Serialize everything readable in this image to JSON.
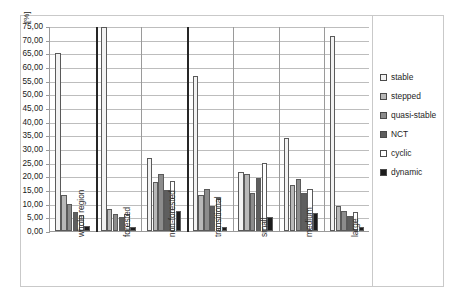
{
  "chart_data": {
    "type": "bar",
    "title": "",
    "subtitle": "",
    "xlabel": "",
    "ylabel": "[%]",
    "ylim": [
      0,
      75
    ],
    "ytick_step": 5,
    "grid": true,
    "legend_position": "right",
    "ytick_labels": [
      "75,00",
      "70,00",
      "65,00",
      "60,00",
      "55,00",
      "50,00",
      "45,00",
      "40,00",
      "35,00",
      "30,00",
      "25,00",
      "20,00",
      "15,00",
      "10,00",
      "5,00",
      "0,00"
    ],
    "categories": [
      "whole region",
      "forested",
      "non-forested",
      "transitional",
      "small",
      "medium",
      "large"
    ],
    "series": [
      {
        "name": "stable",
        "swatch": "#f2f2f2",
        "values": [
          65.2,
          74.8,
          26.8,
          56.6,
          21.5,
          34.0,
          71.5
        ]
      },
      {
        "name": "stepped",
        "swatch": "#b8b8b8",
        "values": [
          13.2,
          8.2,
          18.0,
          13.2,
          21.0,
          17.0,
          9.0
        ]
      },
      {
        "name": "quasi-stable",
        "swatch": "#8c8c8c",
        "values": [
          9.8,
          6.2,
          21.0,
          15.4,
          14.0,
          19.2,
          7.5
        ]
      },
      {
        "name": "NCT",
        "swatch": "#5e5e5e",
        "values": [
          6.8,
          5.0,
          15.0,
          9.0,
          19.5,
          13.8,
          5.5
        ]
      },
      {
        "name": "cyclic",
        "swatch": "#ffffff",
        "values": [
          6.0,
          6.2,
          18.2,
          12.0,
          25.0,
          15.5,
          7.0
        ]
      },
      {
        "name": "dynamic",
        "swatch": "#1c1c1c",
        "values": [
          2.0,
          1.4,
          7.5,
          1.6,
          5.0,
          6.5,
          1.6
        ]
      }
    ]
  },
  "legend": {
    "items": [
      {
        "label": "stable"
      },
      {
        "label": "stepped"
      },
      {
        "label": "quasi-stable"
      },
      {
        "label": "NCT"
      },
      {
        "label": "cyclic"
      },
      {
        "label": "dynamic"
      }
    ]
  }
}
